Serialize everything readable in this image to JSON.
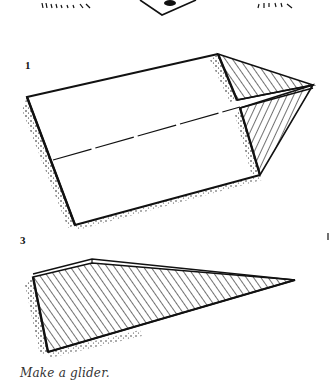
{
  "illustration": {
    "title": "Paper glider folding steps",
    "steps": [
      {
        "label": "1"
      },
      {
        "label": "3"
      }
    ],
    "caption": "Make a glider."
  },
  "colors": {
    "ink": "#111111",
    "background": "#ffffff",
    "caption": "#333333"
  }
}
